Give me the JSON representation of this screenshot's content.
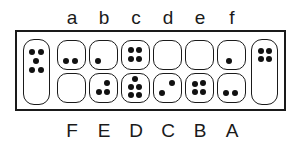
{
  "board": {
    "top_labels": [
      "a",
      "b",
      "c",
      "d",
      "e",
      "f"
    ],
    "bottom_labels": [
      "F",
      "E",
      "D",
      "C",
      "B",
      "A"
    ],
    "top_row": [
      {
        "label": "a",
        "seeds": 2
      },
      {
        "label": "b",
        "seeds": 1
      },
      {
        "label": "c",
        "seeds": 4
      },
      {
        "label": "d",
        "seeds": 0
      },
      {
        "label": "e",
        "seeds": 0
      },
      {
        "label": "f",
        "seeds": 1
      }
    ],
    "bottom_row": [
      {
        "label": "F",
        "seeds": 0
      },
      {
        "label": "E",
        "seeds": 3
      },
      {
        "label": "D",
        "seeds": 5
      },
      {
        "label": "C",
        "seeds": 2
      },
      {
        "label": "B",
        "seeds": 4
      },
      {
        "label": "A",
        "seeds": 2
      }
    ],
    "left_store": {
      "seeds": 5
    },
    "right_store": {
      "seeds": 4
    }
  },
  "colors": {
    "line": "#1a1a1a",
    "seed": "#111111",
    "background": "#ffffff"
  }
}
